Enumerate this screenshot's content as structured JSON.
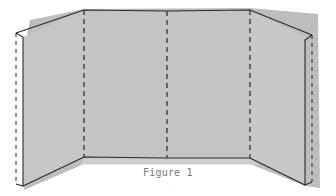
{
  "figure": {
    "caption": "Figure 1",
    "panel_count": 4,
    "colors": {
      "panel_fill": "#c4c4c4",
      "shadow_fill": "#b8b8b8",
      "outline": "#2a2a2a",
      "fold_line": "#333333",
      "caption": "#777777",
      "background": "#ffffff"
    },
    "geometry": {
      "outer_left_edge": {
        "x1": 16,
        "y1": 33,
        "x2": 16,
        "y2": 184
      },
      "inner_left_edge": {
        "x1": 23,
        "y1": 37,
        "x2": 23,
        "y2": 186
      },
      "fold_left": {
        "x": 84,
        "y_top": 10,
        "y_bottom": 157
      },
      "fold_middle": {
        "x": 167,
        "y_top": 11,
        "y_bottom": 158
      },
      "fold_right": {
        "x": 250,
        "y_top": 10,
        "y_bottom": 158
      },
      "inner_right_edge": {
        "x1": 305,
        "y1": 40,
        "x2": 305,
        "y2": 185
      },
      "outer_right_edge": {
        "x1": 312,
        "y1": 35,
        "x2": 312,
        "y2": 182
      }
    }
  }
}
